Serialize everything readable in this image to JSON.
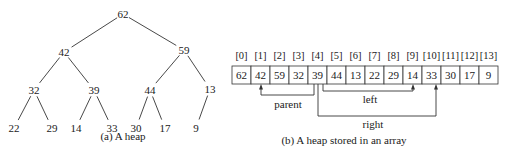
{
  "tree": {
    "caption": "(a) A heap",
    "nodes": [
      "62",
      "42",
      "59",
      "32",
      "39",
      "44",
      "13",
      "22",
      "29",
      "14",
      "33",
      "30",
      "17",
      "9"
    ]
  },
  "array": {
    "caption": "(b) A heap stored in an array",
    "indices": [
      "[0]",
      "[1]",
      "[2]",
      "[3]",
      "[4]",
      "[5]",
      "[6]",
      "[7]",
      "[8]",
      "[9]",
      "[10]",
      "[11]",
      "[12]",
      "[13]"
    ],
    "values": [
      "62",
      "42",
      "59",
      "32",
      "39",
      "44",
      "13",
      "22",
      "29",
      "14",
      "33",
      "30",
      "17",
      "9"
    ],
    "pointers": {
      "parent": {
        "label": "parent",
        "from_index": 4,
        "to_index": 1
      },
      "left": {
        "label": "left",
        "from_index": 4,
        "to_index": 9
      },
      "right": {
        "label": "right",
        "from_index": 4,
        "to_index": 10
      }
    }
  }
}
